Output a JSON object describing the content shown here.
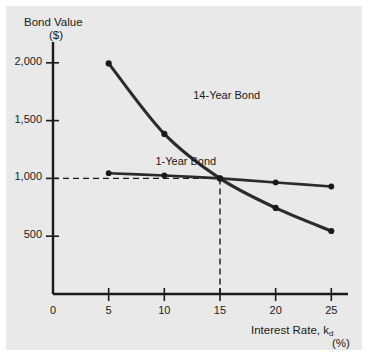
{
  "figure": {
    "background_color": "#e9e9e9",
    "axis_color": "#1a1a1a",
    "series_color": "#2b2b2b"
  },
  "chart_data": {
    "type": "line",
    "title": "",
    "ylabel_line1": "Bond Value",
    "ylabel_line2": "($)",
    "xlabel_line1": "Interest Rate, k",
    "xlabel_sub": "d",
    "xlabel_line2": "(%)",
    "x": [
      5,
      10,
      15,
      20,
      25
    ],
    "xlim": [
      0,
      26.5
    ],
    "ylim": [
      0,
      2180
    ],
    "xticks": [
      0,
      5,
      10,
      15,
      20,
      25
    ],
    "xtick_labels": [
      "0",
      "5",
      "10",
      "15",
      "20",
      "25"
    ],
    "yticks": [
      500,
      1000,
      1500,
      2000
    ],
    "ytick_labels": [
      "500",
      "1,000",
      "1,500",
      "2,000"
    ],
    "grid": false,
    "legend_position": "inline-annotations",
    "series": [
      {
        "name": "14-Year Bond",
        "label": "14-Year Bond",
        "values": [
          1995,
          1385,
          1000,
          745,
          545
        ],
        "label_x": 12.6,
        "label_y": 1700
      },
      {
        "name": "1-Year Bond",
        "label": "1-Year Bond",
        "values": [
          1045,
          1025,
          1000,
          965,
          930
        ],
        "label_x": 9.2,
        "label_y": 1135
      }
    ],
    "annotations": [
      {
        "name": "intersection-guides",
        "type": "dashed-crosshair",
        "x": 15,
        "y": 1000,
        "description": "dashed horizontal line at 1,000 and dashed vertical line at 15%"
      }
    ]
  }
}
